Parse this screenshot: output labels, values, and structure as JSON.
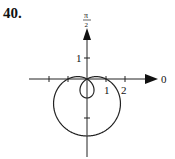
{
  "problem_number": "40.",
  "chart_data": {
    "type": "line",
    "subtype": "polar",
    "equation_shape": "limacon with inner loop, r = 1 - 2 sin(theta)",
    "title": "",
    "axis_labels": {
      "polar_axis": "0",
      "vertical_axis": "π/2"
    },
    "x_ticks": [
      -2,
      -1,
      1,
      2
    ],
    "x_tick_labels": [
      "1",
      "2"
    ],
    "y_ticks": [
      1,
      -2
    ],
    "y_tick_labels": [
      "1"
    ],
    "points": {
      "outer_loop_bottom": [
        0,
        -3
      ],
      "inner_loop_bottom": [
        0,
        -1
      ],
      "x_intercepts": [
        [
          -1,
          0
        ],
        [
          1,
          0
        ]
      ],
      "pole": [
        0,
        0
      ]
    },
    "grid": false
  },
  "labels": {
    "pi_num": "π",
    "pi_den": "2",
    "zero": "0",
    "x1": "1",
    "x2": "2",
    "y1": "1"
  }
}
